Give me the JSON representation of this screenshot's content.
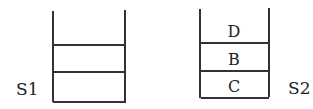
{
  "stacks": [
    {
      "label": "S1",
      "items": [
        "",
        "",
        ""
      ]
    },
    {
      "label": "S2",
      "items": [
        "D",
        "B",
        "C"
      ]
    }
  ]
}
